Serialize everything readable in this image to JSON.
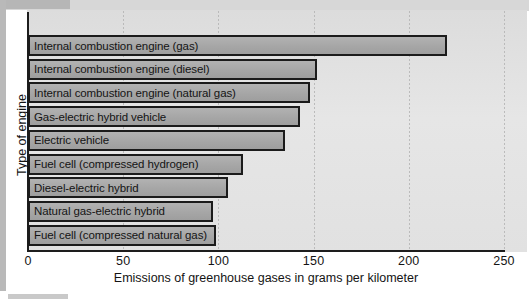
{
  "chart_data": {
    "type": "bar",
    "orientation": "horizontal",
    "title": "",
    "xlabel": "Emissions of greenhouse gases in grams per kilometer",
    "ylabel": "Type of engine",
    "categories": [
      "Internal combustion engine (gas)",
      "Internal combustion engine (diesel)",
      "Internal combustion engine (natural gas)",
      "Gas-electric hybrid vehicle",
      "Electric vehicle",
      "Fuel cell (compressed hydrogen)",
      "Diesel-electric hybrid",
      "Natural gas-electric hybrid",
      "Fuel cell (compressed natural gas)"
    ],
    "values": [
      220,
      152,
      148,
      143,
      135,
      113,
      105,
      97,
      99
    ],
    "xlim": [
      0,
      250
    ],
    "xticks": [
      0,
      50,
      100,
      150,
      200,
      250
    ],
    "xtick_labels": [
      "0",
      "50",
      "100",
      "150",
      "200",
      "250"
    ],
    "grid": true,
    "grid_axis": "x",
    "legend": null,
    "bar_fill": "#aaaaaa",
    "bar_border": "#1b1b1b",
    "plot_background": "#e3e3e3"
  }
}
